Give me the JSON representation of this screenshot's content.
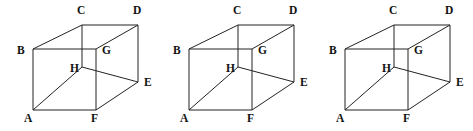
{
  "figure": {
    "background_color": "#ffffff",
    "edge_color": "#232323",
    "label_color": "#111111",
    "repeat_count": 3,
    "cube_offsets_px": [
      0,
      156,
      312
    ],
    "labels": {
      "a": "A",
      "b": "B",
      "c": "C",
      "d": "D",
      "e": "E",
      "f": "F",
      "g": "G",
      "h": "H"
    },
    "vertices_px": {
      "A": [
        33,
        110
      ],
      "B": [
        33,
        49
      ],
      "C": [
        82,
        25
      ],
      "D": [
        138,
        25
      ],
      "E": [
        138,
        82
      ],
      "F": [
        96,
        110
      ],
      "G": [
        96,
        49
      ],
      "H": [
        82,
        67
      ]
    },
    "label_positions_px": {
      "A": [
        24,
        122
      ],
      "B": [
        17,
        54
      ],
      "C": [
        77,
        14
      ],
      "D": [
        133,
        14
      ],
      "E": [
        144,
        86
      ],
      "F": [
        91,
        122
      ],
      "G": [
        102,
        54
      ],
      "H": [
        70,
        72
      ]
    },
    "edges": [
      [
        "A",
        "B"
      ],
      [
        "B",
        "G"
      ],
      [
        "G",
        "F"
      ],
      [
        "F",
        "A"
      ],
      [
        "C",
        "D"
      ],
      [
        "D",
        "E"
      ],
      [
        "E",
        "H"
      ],
      [
        "H",
        "C"
      ],
      [
        "B",
        "C"
      ],
      [
        "G",
        "D"
      ],
      [
        "F",
        "E"
      ],
      [
        "A",
        "H"
      ]
    ]
  }
}
